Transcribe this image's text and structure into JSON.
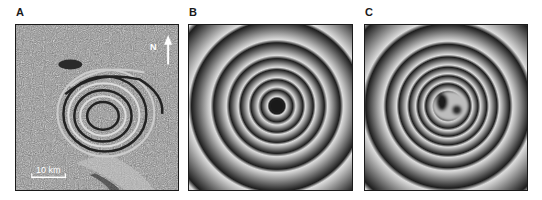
{
  "figure": {
    "panels": [
      {
        "id": "A",
        "label": "A",
        "type": "observed-interferogram",
        "north_arrow_label": "N",
        "scale_bar_label": "10 km"
      },
      {
        "id": "B",
        "label": "B",
        "type": "model-interferogram-single-source"
      },
      {
        "id": "C",
        "label": "C",
        "type": "model-interferogram-double-source"
      }
    ],
    "colors": {
      "fringe_dark": "#1e1e1e",
      "fringe_light": "#d8d8d8",
      "noise_mid": "#8a8a8a",
      "frame": "#1a1a1a",
      "annotation": "#ffffff"
    }
  }
}
